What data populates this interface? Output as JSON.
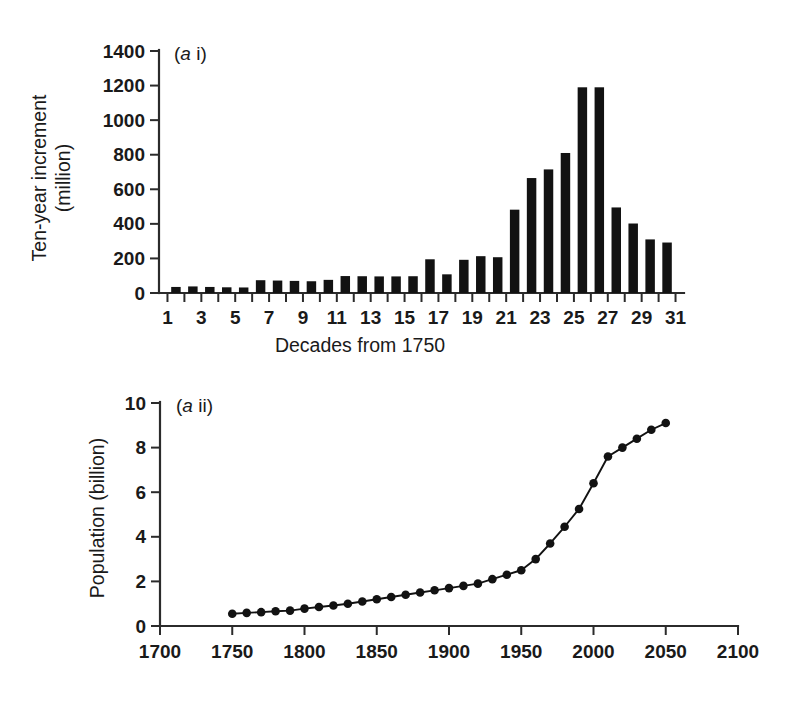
{
  "figure": {
    "background": "#ffffff",
    "ink_color": "#121212"
  },
  "panel_a_i": {
    "label": "(a i)",
    "label_italic_part": "a",
    "label_roman_part": " i)",
    "label_open_paren": "(",
    "ylabel_line1": "Ten-year increment",
    "ylabel_line2": "(million)",
    "xlabel": "Decades from 1750",
    "y_ticks": [
      "0",
      "200",
      "400",
      "600",
      "800",
      "1000",
      "1200",
      "1400"
    ],
    "x_ticks": [
      "1",
      "3",
      "5",
      "7",
      "9",
      "11",
      "13",
      "15",
      "17",
      "19",
      "21",
      "23",
      "25",
      "27",
      "29",
      "31"
    ]
  },
  "panel_a_ii": {
    "label": "(a ii)",
    "label_italic_part": "a",
    "label_roman_part": " ii)",
    "label_open_paren": "(",
    "ylabel": "Population (billion)",
    "xlabel": "",
    "y_ticks": [
      "0",
      "2",
      "4",
      "6",
      "8",
      "10"
    ],
    "x_ticks": [
      "1700",
      "1750",
      "1800",
      "1850",
      "1900",
      "1950",
      "2000",
      "2050",
      "2100"
    ]
  },
  "chart_data": [
    {
      "type": "bar",
      "title": "(a i)",
      "xlabel": "Decades from 1750",
      "ylabel": "Ten-year increment (million)",
      "grid": false,
      "legend": null,
      "xlim": [
        1,
        31
      ],
      "ylim": [
        0,
        1400
      ],
      "ytick_values": [
        0,
        200,
        400,
        600,
        800,
        1000,
        1200,
        1400
      ],
      "xtick_values": [
        1,
        3,
        5,
        7,
        9,
        11,
        13,
        15,
        17,
        19,
        21,
        23,
        25,
        27,
        29,
        31
      ],
      "categories": [
        2,
        3,
        4,
        5,
        6,
        7,
        8,
        9,
        10,
        11,
        12,
        13,
        14,
        15,
        16,
        17,
        18,
        19,
        20,
        21,
        22,
        23,
        24,
        25,
        26,
        27,
        28,
        29,
        30,
        31
      ],
      "values": [
        35,
        38,
        35,
        33,
        32,
        74,
        72,
        70,
        68,
        76,
        98,
        97,
        96,
        96,
        97,
        195,
        108,
        192,
        213,
        207,
        482,
        665,
        715,
        810,
        1190,
        1190,
        495,
        402,
        310,
        292
      ]
    },
    {
      "type": "line",
      "title": "(a ii)",
      "xlabel": "",
      "ylabel": "Population (billion)",
      "grid": false,
      "legend": null,
      "xlim": [
        1700,
        2100
      ],
      "ylim": [
        0,
        10
      ],
      "ytick_values": [
        0,
        2,
        4,
        6,
        8,
        10
      ],
      "xtick_values": [
        1700,
        1750,
        1800,
        1850,
        1900,
        1950,
        2000,
        2050,
        2100
      ],
      "marker": "filled-circle",
      "x": [
        1750,
        1760,
        1770,
        1780,
        1790,
        1800,
        1810,
        1820,
        1830,
        1840,
        1850,
        1860,
        1870,
        1880,
        1890,
        1900,
        1910,
        1920,
        1930,
        1940,
        1950,
        1960,
        1970,
        1980,
        1990,
        2000,
        2010,
        2020,
        2030,
        2040,
        2050
      ],
      "values": [
        0.55,
        0.59,
        0.62,
        0.66,
        0.69,
        0.78,
        0.85,
        0.92,
        1.0,
        1.1,
        1.2,
        1.3,
        1.4,
        1.5,
        1.6,
        1.7,
        1.8,
        1.9,
        2.1,
        2.3,
        2.5,
        3.0,
        3.7,
        4.45,
        5.25,
        6.4,
        7.6,
        8.0,
        8.4,
        8.8,
        9.1
      ]
    }
  ]
}
